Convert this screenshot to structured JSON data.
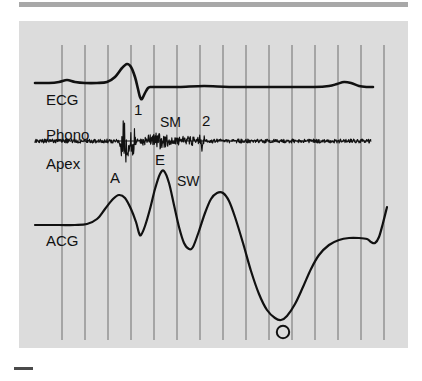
{
  "figure": {
    "background_color": "#ffffff",
    "panel_background_color": "#dcdcdc",
    "trace_color": "#111111",
    "grid_color": "#6e6e6e",
    "rule_color": "#a8a8a8"
  },
  "traces": [
    {
      "key": "ecg",
      "label": "ECG"
    },
    {
      "key": "phono",
      "label": "Phono"
    },
    {
      "key": "apex",
      "label": "Apex"
    },
    {
      "key": "acg",
      "label": "ACG"
    }
  ],
  "labels": {
    "ecg": "ECG",
    "phono": "Phono",
    "apex": "Apex",
    "acg": "ACG"
  },
  "annotations": [
    {
      "key": "s1",
      "text": "1",
      "trace": "phono",
      "meaning": "first-heart-sound"
    },
    {
      "key": "sm",
      "text": "SM",
      "trace": "phono",
      "meaning": "systolic-murmur"
    },
    {
      "key": "s2",
      "text": "2",
      "trace": "phono",
      "meaning": "second-heart-sound"
    },
    {
      "key": "a",
      "text": "A",
      "trace": "acg",
      "meaning": "a-wave"
    },
    {
      "key": "e",
      "text": "E",
      "trace": "acg",
      "meaning": "e-point"
    },
    {
      "key": "sw",
      "text": "SW",
      "trace": "acg",
      "meaning": "systolic-wave"
    },
    {
      "key": "o",
      "text": "",
      "trace": "acg",
      "meaning": "o-point-marker-circle"
    }
  ],
  "annotation_text": {
    "s1": "1",
    "sm": "SM",
    "s2": "2",
    "a": "A",
    "e": "E",
    "sw": "SW"
  },
  "grid": {
    "orientation": "vertical",
    "count": 15,
    "first_x": 43,
    "spacing": 23,
    "top": 24,
    "bottom": 319
  },
  "chart_data": {
    "type": "line",
    "title": "",
    "xlabel": "",
    "ylabel": "",
    "series": [
      {
        "name": "ECG",
        "baseline_y": 62,
        "points": [
          [
            16,
            62
          ],
          [
            30,
            62
          ],
          [
            40,
            61
          ],
          [
            48,
            59
          ],
          [
            56,
            61
          ],
          [
            66,
            62
          ],
          [
            78,
            62
          ],
          [
            88,
            61
          ],
          [
            96,
            56
          ],
          [
            103,
            47
          ],
          [
            108,
            43
          ],
          [
            112,
            46
          ],
          [
            116,
            56
          ],
          [
            119,
            68
          ],
          [
            121,
            76
          ],
          [
            123,
            78
          ],
          [
            126,
            72
          ],
          [
            129,
            67
          ],
          [
            132,
            66
          ],
          [
            140,
            66
          ],
          [
            160,
            66
          ],
          [
            185,
            65
          ],
          [
            210,
            66
          ],
          [
            240,
            66
          ],
          [
            270,
            66
          ],
          [
            295,
            66
          ],
          [
            310,
            65
          ],
          [
            318,
            63
          ],
          [
            325,
            61
          ],
          [
            332,
            62
          ],
          [
            340,
            65
          ],
          [
            348,
            66
          ],
          [
            354,
            66
          ]
        ]
      },
      {
        "name": "Phono",
        "baseline_y": 120,
        "noise_amplitude_baseline": 2,
        "burst_s1": {
          "x_start": 100,
          "x_end": 120,
          "amplitude": 26
        },
        "burst_sm": {
          "x_start": 122,
          "x_end": 175,
          "amplitude": 9
        },
        "burst_s2": {
          "x_start": 178,
          "x_end": 187,
          "amplitude": 12
        },
        "x_end": 352
      },
      {
        "name": "ACG",
        "points": [
          [
            16,
            204
          ],
          [
            40,
            204
          ],
          [
            56,
            204
          ],
          [
            68,
            203
          ],
          [
            78,
            198
          ],
          [
            86,
            188
          ],
          [
            94,
            178
          ],
          [
            100,
            174
          ],
          [
            106,
            177
          ],
          [
            112,
            188
          ],
          [
            117,
            201
          ],
          [
            120,
            212
          ],
          [
            122,
            214
          ],
          [
            126,
            205
          ],
          [
            131,
            188
          ],
          [
            136,
            168
          ],
          [
            141,
            153
          ],
          [
            145,
            150
          ],
          [
            150,
            162
          ],
          [
            155,
            184
          ],
          [
            160,
            206
          ],
          [
            165,
            222
          ],
          [
            170,
            228
          ],
          [
            174,
            226
          ],
          [
            180,
            210
          ],
          [
            186,
            192
          ],
          [
            192,
            178
          ],
          [
            198,
            172
          ],
          [
            204,
            172
          ],
          [
            210,
            180
          ],
          [
            216,
            196
          ],
          [
            224,
            222
          ],
          [
            232,
            250
          ],
          [
            240,
            273
          ],
          [
            248,
            289
          ],
          [
            256,
            297
          ],
          [
            262,
            299
          ],
          [
            268,
            295
          ],
          [
            276,
            283
          ],
          [
            284,
            266
          ],
          [
            292,
            248
          ],
          [
            300,
            234
          ],
          [
            310,
            224
          ],
          [
            320,
            219
          ],
          [
            330,
            217
          ],
          [
            340,
            217
          ],
          [
            348,
            218
          ],
          [
            352,
            221
          ],
          [
            356,
            222
          ],
          [
            360,
            216
          ],
          [
            364,
            202
          ],
          [
            368,
            186
          ]
        ]
      }
    ]
  }
}
